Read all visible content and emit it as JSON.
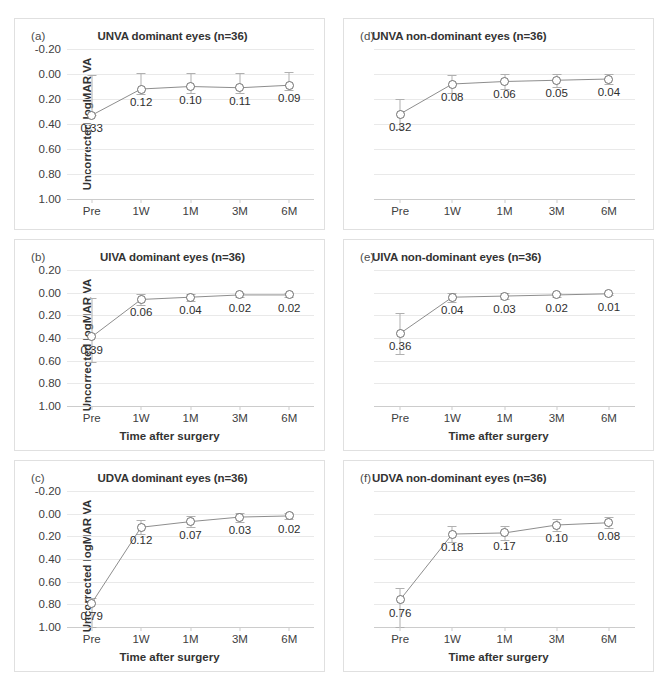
{
  "figure": {
    "axis_label_y": "Uncorrected logMAR VA",
    "axis_label_x": "Time after surgery",
    "categories": [
      "Pre",
      "1W",
      "1M",
      "3M",
      "6M"
    ],
    "colors": {
      "line": "#808080",
      "marker_fill": "#ffffff",
      "marker_stroke": "#6e6e6e",
      "errorbar": "#b0b0b0",
      "gridline": "#e9e9e9",
      "axis": "#cccccc",
      "panel_border": "#e0e0e0",
      "text": "#333333"
    }
  },
  "chart_data": [
    {
      "type": "line",
      "panel": "a",
      "letter": "(a)",
      "title": "UNVA dominant eyes (n=36)",
      "xlabel": "",
      "ylabel": "Uncorrected logMAR VA",
      "categories": [
        "Pre",
        "1W",
        "1M",
        "3M",
        "6M"
      ],
      "values": [
        0.33,
        0.12,
        0.1,
        0.11,
        0.09
      ],
      "labels": [
        "0.33",
        "0.12",
        "0.10",
        "0.11",
        "0.09"
      ],
      "err_low": [
        0.0,
        0.04,
        0.05,
        0.04,
        0.04
      ],
      "err_high": [
        0.32,
        0.13,
        0.11,
        0.12,
        0.11
      ],
      "yticks": [
        "-0.20",
        "0.00",
        "0.20",
        "0.40",
        "0.60",
        "0.80",
        "1.00"
      ],
      "ytickvals": [
        -0.2,
        0.0,
        0.2,
        0.4,
        0.6,
        0.8,
        1.0
      ],
      "ylim": [
        -0.2,
        1.0
      ],
      "y_inverted": true,
      "grid": true,
      "legend": "none"
    },
    {
      "type": "line",
      "panel": "d",
      "letter": "(d)",
      "title": "UNVA non-dominant eyes (n=36)",
      "xlabel": "",
      "ylabel": "",
      "categories": [
        "Pre",
        "1W",
        "1M",
        "3M",
        "6M"
      ],
      "values": [
        0.32,
        0.08,
        0.06,
        0.05,
        0.04
      ],
      "labels": [
        "0.32",
        "0.08",
        "0.06",
        "0.05",
        "0.04"
      ],
      "err_low": [
        0.12,
        0.07,
        0.06,
        0.05,
        0.04
      ],
      "err_high": [
        0.12,
        0.07,
        0.06,
        0.05,
        0.04
      ],
      "yticks": [],
      "ytickvals": [
        -0.2,
        0.0,
        0.2,
        0.4,
        0.6,
        0.8,
        1.0
      ],
      "ylim": [
        -0.2,
        1.0
      ],
      "y_inverted": true,
      "grid": true,
      "legend": "none"
    },
    {
      "type": "line",
      "panel": "b",
      "letter": "(b)",
      "title": "UIVA dominant eyes (n=36)",
      "xlabel": "Time after surgery",
      "ylabel": "Uncorrected logMAR VA",
      "categories": [
        "Pre",
        "1W",
        "1M",
        "3M",
        "6M"
      ],
      "values": [
        0.39,
        0.06,
        0.04,
        0.02,
        0.02
      ],
      "labels": [
        "0.39",
        "0.06",
        "0.04",
        "0.02",
        "0.02"
      ],
      "err_low": [
        0.22,
        0.05,
        0.03,
        0.02,
        0.02
      ],
      "err_high": [
        0.34,
        0.05,
        0.03,
        0.02,
        0.02
      ],
      "yticks": [
        "0.20",
        "0.00",
        "0.20",
        "0.40",
        "0.60",
        "0.80",
        "1.00"
      ],
      "ytickvals": [
        -0.2,
        0.0,
        0.2,
        0.4,
        0.6,
        0.8,
        1.0
      ],
      "ylim": [
        -0.2,
        1.0
      ],
      "y_inverted": true,
      "grid": true,
      "legend": "none"
    },
    {
      "type": "line",
      "panel": "e",
      "letter": "(e)",
      "title": "UIVA non-dominant eyes (n=36)",
      "xlabel": "Time after surgery",
      "ylabel": "",
      "categories": [
        "Pre",
        "1W",
        "1M",
        "3M",
        "6M"
      ],
      "values": [
        0.36,
        0.04,
        0.03,
        0.02,
        0.01
      ],
      "labels": [
        "0.36",
        "0.04",
        "0.03",
        "0.02",
        "0.01"
      ],
      "err_low": [
        0.18,
        0.04,
        0.03,
        0.02,
        0.01
      ],
      "err_high": [
        0.18,
        0.04,
        0.03,
        0.02,
        0.01
      ],
      "yticks": [],
      "ytickvals": [
        -0.2,
        0.0,
        0.2,
        0.4,
        0.6,
        0.8,
        1.0
      ],
      "ylim": [
        -0.2,
        1.0
      ],
      "y_inverted": true,
      "grid": true,
      "legend": "none"
    },
    {
      "type": "line",
      "panel": "c",
      "letter": "(c)",
      "title": "UDVA dominant eyes (n=36)",
      "xlabel": "Time after surgery",
      "ylabel": "Uncorrected logMAR VA",
      "categories": [
        "Pre",
        "1W",
        "1M",
        "3M",
        "6M"
      ],
      "values": [
        0.79,
        0.12,
        0.07,
        0.03,
        0.02
      ],
      "labels": [
        "0.79",
        "0.12",
        "0.07",
        "0.03",
        "0.02"
      ],
      "err_low": [
        0.43,
        0.06,
        0.05,
        0.04,
        0.03
      ],
      "err_high": [
        0.05,
        0.06,
        0.05,
        0.04,
        0.03
      ],
      "yticks": [
        "-0.20",
        "0.00",
        "0.20",
        "0.40",
        "0.60",
        "0.80",
        "1.00"
      ],
      "ytickvals": [
        -0.2,
        0.0,
        0.2,
        0.4,
        0.6,
        0.8,
        1.0
      ],
      "ylim": [
        -0.2,
        1.0
      ],
      "y_inverted": true,
      "grid": true,
      "legend": "none"
    },
    {
      "type": "line",
      "panel": "f",
      "letter": "(f)",
      "title": "UDVA non-dominant eyes (n=36)",
      "xlabel": "Time after surgery",
      "ylabel": "",
      "categories": [
        "Pre",
        "1W",
        "1M",
        "3M",
        "6M"
      ],
      "values": [
        0.76,
        0.18,
        0.17,
        0.1,
        0.08
      ],
      "labels": [
        "0.76",
        "0.18",
        "0.17",
        "0.10",
        "0.08"
      ],
      "err_low": [
        0.38,
        0.07,
        0.06,
        0.05,
        0.05
      ],
      "err_high": [
        0.1,
        0.07,
        0.06,
        0.05,
        0.05
      ],
      "yticks": [],
      "ytickvals": [
        -0.2,
        0.0,
        0.2,
        0.4,
        0.6,
        0.8,
        1.0
      ],
      "ylim": [
        -0.2,
        1.0
      ],
      "y_inverted": true,
      "grid": true,
      "legend": "none"
    }
  ]
}
